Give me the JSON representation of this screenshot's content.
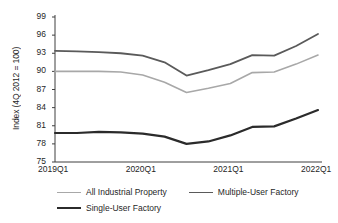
{
  "chart_data": {
    "type": "line",
    "title": "",
    "xlabel": "",
    "ylabel": "Index (4Q 2012 = 100)",
    "ylim": [
      75,
      99
    ],
    "yticks": [
      75,
      78,
      81,
      84,
      87,
      90,
      93,
      96,
      99
    ],
    "xticks": [
      "2019Q1",
      "2020Q1",
      "2021Q1",
      "2022Q1"
    ],
    "x": [
      "2019Q1",
      "2019Q2",
      "2019Q3",
      "2019Q4",
      "2020Q1",
      "2020Q2",
      "2020Q3",
      "2020Q4",
      "2021Q1",
      "2021Q2",
      "2021Q3",
      "2021Q4",
      "2022Q1"
    ],
    "grid": false,
    "legend_position": "bottom",
    "series": [
      {
        "name": "All Industrial Property",
        "color": "#a8a8a8",
        "values": [
          90.0,
          90.0,
          90.0,
          89.9,
          89.4,
          88.2,
          86.5,
          87.2,
          88.0,
          89.8,
          89.9,
          91.2,
          92.7
        ]
      },
      {
        "name": "Multiple-User Factory",
        "color": "#5a5a5a",
        "values": [
          93.4,
          93.3,
          93.2,
          93.0,
          92.6,
          91.5,
          89.3,
          90.2,
          91.2,
          92.7,
          92.6,
          94.2,
          96.2
        ]
      },
      {
        "name": "Single-User Factory",
        "color": "#2b2b2b",
        "values": [
          79.8,
          79.8,
          80.0,
          79.9,
          79.7,
          79.2,
          78.0,
          78.4,
          79.4,
          80.8,
          80.9,
          82.2,
          83.6
        ]
      }
    ]
  },
  "axis": {
    "y_title": "Index (4Q 2012 = 100)",
    "y_labels": [
      "99",
      "96",
      "93",
      "90",
      "87",
      "84",
      "81",
      "78",
      "75"
    ],
    "x_labels": [
      "2019Q1",
      "2020Q1",
      "2021Q1",
      "2022Q1"
    ]
  },
  "legend": {
    "items": [
      {
        "label": "All Industrial Property",
        "color": "#a8a8a8",
        "width": "1.6px"
      },
      {
        "label": "Multiple-User Factory",
        "color": "#5a5a5a",
        "width": "1.8px"
      },
      {
        "label": "Single-User Factory",
        "color": "#2b2b2b",
        "width": "2.2px"
      }
    ]
  },
  "colors": {
    "axis_line": "#3f3f3f",
    "text": "#1f1f1f",
    "background": "#ffffff"
  }
}
